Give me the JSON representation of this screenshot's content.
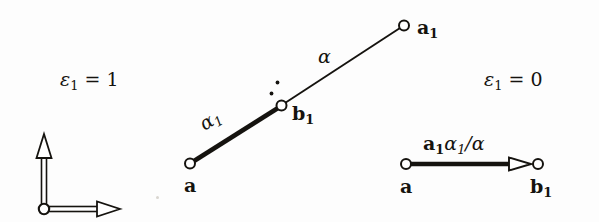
{
  "figure": {
    "name": "edge-contraction-diagram",
    "background_color": "#fdfdfd",
    "ink_color": "#15130f",
    "width": 599,
    "height": 222
  },
  "axes": {
    "name": "coordinate-frame",
    "origin": {
      "x": 44,
      "y": 209
    },
    "x_axis": {
      "label": "",
      "to_x": 118,
      "to_y": 209
    },
    "y_axis": {
      "label": "",
      "to_x": 44,
      "to_y": 138
    },
    "arrow_style": "hollow-outline",
    "origin_marker": "hollow-circle"
  },
  "conditions": {
    "left": {
      "symbol": "ε",
      "subscript": "1",
      "relation": "=",
      "value": "1",
      "full": "ε₁ = 1"
    },
    "right": {
      "symbol": "ε",
      "subscript": "1",
      "relation": "=",
      "value": "0",
      "full": "ε₁ = 0"
    }
  },
  "left_diagram": {
    "name": "two-segment-path",
    "nodes": [
      {
        "id": "a",
        "label": "a",
        "sublabel": "",
        "x": 190,
        "y": 163,
        "marker": "hollow-circle"
      },
      {
        "id": "b1",
        "label": "b",
        "sublabel": "1",
        "x": 281,
        "y": 106,
        "marker": "hollow-circle"
      },
      {
        "id": "a1",
        "label": "a",
        "sublabel": "1",
        "x": 404,
        "y": 25,
        "marker": "hollow-circle"
      }
    ],
    "edges": [
      {
        "from": "a",
        "to": "b1",
        "weight_symbol": "α",
        "weight_sub": "1",
        "weight": "α₁",
        "thickness": "thick",
        "arrow": false
      },
      {
        "from": "b1",
        "to": "a1",
        "weight_symbol": "α",
        "weight_sub": "",
        "weight": "α",
        "thickness": "thin",
        "arrow": false
      }
    ],
    "marks": [
      {
        "name": "diagonal-dots",
        "x": 277,
        "y": 84
      },
      {
        "name": "diagonal-dots",
        "x": 271,
        "y": 93
      }
    ]
  },
  "right_diagram": {
    "name": "contracted-segment",
    "nodes": [
      {
        "id": "a",
        "label": "a",
        "sublabel": "",
        "x": 406,
        "y": 164,
        "marker": "hollow-circle"
      },
      {
        "id": "b1",
        "label": "b",
        "sublabel": "1",
        "x": 538,
        "y": 164,
        "marker": "hollow-circle"
      }
    ],
    "edges": [
      {
        "from": "a",
        "to": "b1",
        "thickness": "thick",
        "arrow": true,
        "arrow_style": "hollow-outline"
      }
    ],
    "edge_label": {
      "bold_part": "a",
      "bold_sub": "1",
      "italic_part": "α",
      "italic_sub": "1",
      "divider": "/",
      "denominator": "α",
      "full": "a₁α₁/α"
    }
  }
}
